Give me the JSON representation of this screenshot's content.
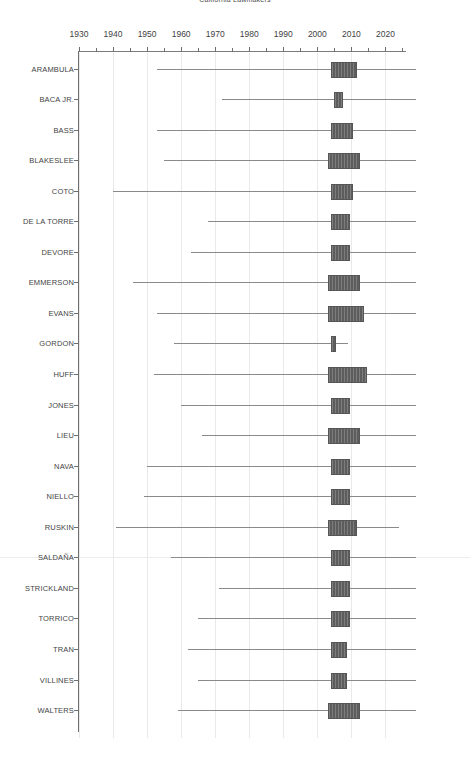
{
  "chart_data": {
    "type": "bar",
    "subtype": "box-plot-horizontal",
    "title": "California Lawmakers",
    "xlabel": "",
    "ylabel": "",
    "xlim": [
      1928,
      2030
    ],
    "xticks": [
      1930,
      1935,
      1940,
      1945,
      1950,
      1955,
      1960,
      1965,
      1970,
      1975,
      1980,
      1985,
      1990,
      1995,
      2000,
      2005,
      2010,
      2015,
      2020,
      2025
    ],
    "xtick_labels_major": [
      "1930",
      "1940",
      "1950",
      "1960",
      "1970",
      "1980",
      "1990",
      "2000",
      "2010",
      "2020"
    ],
    "xticks_major": [
      1930,
      1940,
      1950,
      1960,
      1970,
      1980,
      1990,
      2000,
      2010,
      2020
    ],
    "grid": true,
    "grid_axis": "x",
    "legend": "none",
    "categories": [
      "ARAMBULA",
      "BACA JR.",
      "BASS",
      "BLAKESLEE",
      "COTO",
      "DE LA TORRE",
      "DEVORE",
      "EMMERSON",
      "EVANS",
      "GORDON",
      "HUFF",
      "JONES",
      "LIEU",
      "NAVA",
      "NIELLO",
      "RUSKIN",
      "SALDAÑA",
      "STRICKLAND",
      "TORRICO",
      "TRAN",
      "VILLINES",
      "WALTERS"
    ],
    "boxes": [
      {
        "label": "ARAMBULA",
        "whisker_low": 1953,
        "q1": 2004,
        "median": 2007,
        "q3": 2011,
        "whisker_high": 2029
      },
      {
        "label": "BACA JR.",
        "whisker_low": 1972,
        "q1": 2005,
        "median": 2006,
        "q3": 2007,
        "whisker_high": 2029
      },
      {
        "label": "BASS",
        "whisker_low": 1953,
        "q1": 2004,
        "median": 2007,
        "q3": 2010,
        "whisker_high": 2029
      },
      {
        "label": "BLAKESLEE",
        "whisker_low": 1955,
        "q1": 2003,
        "median": 2007,
        "q3": 2012,
        "whisker_high": 2029
      },
      {
        "label": "COTO",
        "whisker_low": 1940,
        "q1": 2004,
        "median": 2007,
        "q3": 2010,
        "whisker_high": 2029
      },
      {
        "label": "DE LA TORRE",
        "whisker_low": 1968,
        "q1": 2004,
        "median": 2007,
        "q3": 2009,
        "whisker_high": 2029
      },
      {
        "label": "DEVORE",
        "whisker_low": 1963,
        "q1": 2004,
        "median": 2007,
        "q3": 2009,
        "whisker_high": 2029
      },
      {
        "label": "EMMERSON",
        "whisker_low": 1946,
        "q1": 2003,
        "median": 2007,
        "q3": 2012,
        "whisker_high": 2029
      },
      {
        "label": "EVANS",
        "whisker_low": 1953,
        "q1": 2003,
        "median": 2008,
        "q3": 2013,
        "whisker_high": 2029
      },
      {
        "label": "GORDON",
        "whisker_low": 1958,
        "q1": 2004,
        "median": 2004,
        "q3": 2005,
        "whisker_high": 2009
      },
      {
        "label": "HUFF",
        "whisker_low": 1952,
        "q1": 2003,
        "median": 2008,
        "q3": 2014,
        "whisker_high": 2029
      },
      {
        "label": "JONES",
        "whisker_low": 1960,
        "q1": 2004,
        "median": 2007,
        "q3": 2009,
        "whisker_high": 2029
      },
      {
        "label": "LIEU",
        "whisker_low": 1966,
        "q1": 2003,
        "median": 2007,
        "q3": 2012,
        "whisker_high": 2029
      },
      {
        "label": "NAVA",
        "whisker_low": 1950,
        "q1": 2004,
        "median": 2006,
        "q3": 2009,
        "whisker_high": 2029
      },
      {
        "label": "NIELLO",
        "whisker_low": 1949,
        "q1": 2004,
        "median": 2007,
        "q3": 2009,
        "whisker_high": 2029
      },
      {
        "label": "RUSKIN",
        "whisker_low": 1941,
        "q1": 2003,
        "median": 2007,
        "q3": 2011,
        "whisker_high": 2024
      },
      {
        "label": "SALDAÑA",
        "whisker_low": 1957,
        "q1": 2004,
        "median": 2006,
        "q3": 2009,
        "whisker_high": 2029
      },
      {
        "label": "STRICKLAND",
        "whisker_low": 1971,
        "q1": 2004,
        "median": 2006,
        "q3": 2009,
        "whisker_high": 2029
      },
      {
        "label": "TORRICO",
        "whisker_low": 1965,
        "q1": 2004,
        "median": 2007,
        "q3": 2009,
        "whisker_high": 2029
      },
      {
        "label": "TRAN",
        "whisker_low": 1962,
        "q1": 2004,
        "median": 2006,
        "q3": 2008,
        "whisker_high": 2029
      },
      {
        "label": "VILLINES",
        "whisker_low": 1965,
        "q1": 2004,
        "median": 2006,
        "q3": 2008,
        "whisker_high": 2029
      },
      {
        "label": "WALTERS",
        "whisker_low": 1959,
        "q1": 2003,
        "median": 2008,
        "q3": 2012,
        "whisker_high": 2029
      }
    ],
    "colors": {
      "box_fill": "#5d5d5d",
      "box_edge": "#565656",
      "whisker": "#8a8a8a",
      "axis": "#6f6f6f",
      "grid": "#e9e9e9",
      "text": "#444444"
    }
  }
}
